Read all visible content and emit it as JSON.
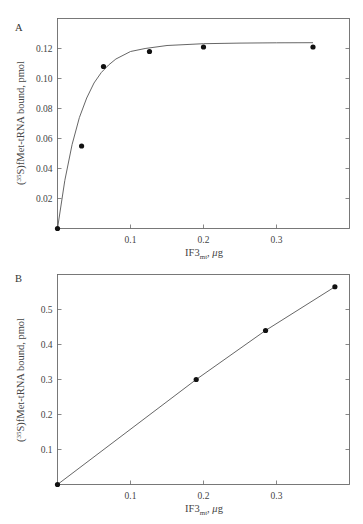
{
  "chart_data": [
    {
      "panel": "A",
      "type": "scatter",
      "title": "",
      "xlabel": "IF3",
      "xlabel_sub": "mt",
      "xlabel_unit": ", μg",
      "ylabel": "(35S)fMet-tRNA bound, pmol",
      "ylabel_sup": "35",
      "xlim": [
        0,
        0.4
      ],
      "ylim": [
        0,
        0.14
      ],
      "xticks": [
        0.1,
        0.2,
        0.3
      ],
      "xtick_labels": [
        "0.1",
        "0.2",
        "0.3"
      ],
      "yticks": [
        0.02,
        0.04,
        0.06,
        0.08,
        0.1,
        0.12
      ],
      "ytick_labels": [
        "0.02",
        "0.04",
        "0.06",
        "0.08",
        "0.10",
        "0.12"
      ],
      "grid": false,
      "series": [
        {
          "name": "data",
          "x": [
            0,
            0.033,
            0.063,
            0.126,
            0.2,
            0.35
          ],
          "y": [
            0,
            0.055,
            0.108,
            0.118,
            0.121,
            0.121
          ]
        },
        {
          "name": "fit (hyperbolic/saturation curve)",
          "x": [
            0,
            0.01,
            0.02,
            0.03,
            0.04,
            0.05,
            0.06,
            0.07,
            0.08,
            0.1,
            0.12,
            0.15,
            0.2,
            0.25,
            0.3,
            0.35
          ],
          "y": [
            0,
            0.032,
            0.056,
            0.074,
            0.087,
            0.097,
            0.104,
            0.109,
            0.113,
            0.118,
            0.12,
            0.122,
            0.1232,
            0.1236,
            0.1238,
            0.1239
          ]
        }
      ]
    },
    {
      "panel": "B",
      "type": "line",
      "title": "",
      "xlabel": "IF3",
      "xlabel_sub": "mt",
      "xlabel_unit": ", μg",
      "ylabel": "(35S)fMet-tRNA bound, pmol",
      "ylabel_sup": "35",
      "xlim": [
        0,
        0.4
      ],
      "ylim": [
        0,
        0.6
      ],
      "xticks": [
        0.1,
        0.2,
        0.3
      ],
      "xtick_labels": [
        "0.1",
        "0.2",
        "0.3"
      ],
      "yticks": [
        0.1,
        0.2,
        0.3,
        0.4,
        0.5
      ],
      "ytick_labels": [
        "0.1",
        "0.2",
        "0.3",
        "0.4",
        "0.5"
      ],
      "grid": false,
      "series": [
        {
          "name": "data",
          "x": [
            0,
            0.19,
            0.285,
            0.38
          ],
          "y": [
            0,
            0.3,
            0.44,
            0.565
          ]
        }
      ]
    }
  ],
  "panels": {
    "a": {
      "label": "A"
    },
    "b": {
      "label": "B"
    }
  },
  "axis_text": {
    "ylabel_prefix": "(",
    "ylabel_sup": "35",
    "ylabel_rest": "S)fMet-tRNA bound, pmol",
    "xlabel_main": "IF3",
    "xlabel_sub": "mt",
    "xlabel_comma": ", ",
    "xlabel_mu": "μ",
    "xlabel_unit": "g"
  },
  "colors": {
    "axis": "#6a6a6a",
    "line": "#555555",
    "marker": "#111111"
  }
}
